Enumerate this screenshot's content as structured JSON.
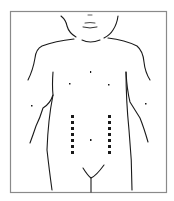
{
  "diagram": {
    "type": "anatomical-line-drawing",
    "frame": {
      "x": 10,
      "y": 11,
      "width": 157,
      "height": 182,
      "stroke": "#8a8a8a"
    },
    "line_color": "#1a1a1a",
    "markers": {
      "color": "#1a1a1a",
      "left_column": {
        "x": 72,
        "y_start": 115,
        "count": 7,
        "spacing": 6
      },
      "right_column": {
        "x": 109,
        "y_start": 115,
        "count": 7,
        "spacing": 6
      }
    }
  }
}
